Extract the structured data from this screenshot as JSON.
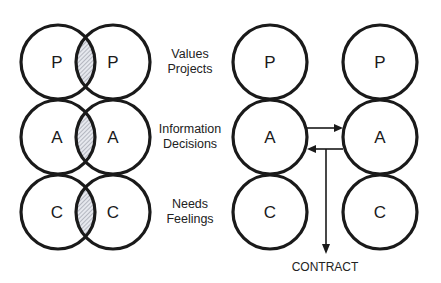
{
  "left_diagram": {
    "rows": [
      {
        "left": "P",
        "right": "P"
      },
      {
        "left": "A",
        "right": "A"
      },
      {
        "left": "C",
        "right": "C"
      }
    ]
  },
  "middle_labels": [
    {
      "line1": "Values",
      "line2": "Projects"
    },
    {
      "line1": "Information",
      "line2": "Decisions"
    },
    {
      "line1": "Needs",
      "line2": "Feelings"
    }
  ],
  "right_diagram": {
    "rows": [
      {
        "left": "P",
        "right": "P"
      },
      {
        "left": "A",
        "right": "A"
      },
      {
        "left": "C",
        "right": "C"
      }
    ],
    "arrow_label": "CONTRACT"
  },
  "colors": {
    "stroke": "#1a1a1a",
    "hatch": "#8a8f9a",
    "background": "#ffffff"
  }
}
